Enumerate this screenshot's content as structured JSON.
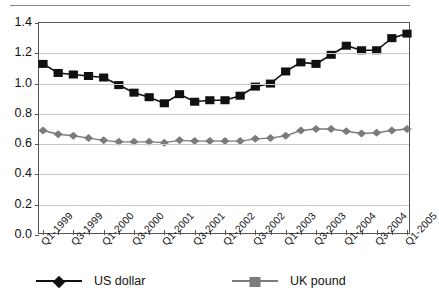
{
  "chart_data": {
    "type": "line",
    "title": "",
    "subtitle": "",
    "xlabel": "",
    "ylabel": "",
    "ylim": [
      0.0,
      1.4
    ],
    "ytick_values": [
      0.0,
      0.2,
      0.4,
      0.6,
      0.8,
      1.0,
      1.2,
      1.4
    ],
    "ytick_labels": [
      "0.0",
      "0.2",
      "0.4",
      "0.6",
      "0.8",
      "1.0",
      "1.2",
      "1.4"
    ],
    "grid": true,
    "grid_axis": "y",
    "legend_position": "bottom",
    "x": [
      "Q1-1999",
      "Q2-1999",
      "Q3-1999",
      "Q4-1999",
      "Q1-2000",
      "Q2-2000",
      "Q3-2000",
      "Q4-2000",
      "Q1-2001",
      "Q2-2001",
      "Q3-2001",
      "Q4-2001",
      "Q1-2002",
      "Q2-2002",
      "Q3-2002",
      "Q4-2002",
      "Q1-2003",
      "Q2-2003",
      "Q3-2003",
      "Q4-2003",
      "Q1-2004",
      "Q2-2004",
      "Q3-2004",
      "Q4-2004",
      "Q1-2005"
    ],
    "xtick_labels_shown": [
      "Q1-1999",
      "Q3-1999",
      "Q1-2000",
      "Q2-2000",
      "Q1-2001",
      "Q2-2001",
      "Q1-2002",
      "Q2-2002",
      "Q1-2003",
      "Q2-2003",
      "Q1-2004",
      "Q2-2004",
      "Q1-2005"
    ],
    "xtick_label_rotation": -47,
    "xtick_label_interval": 2,
    "series": [
      {
        "name": "US dollar",
        "marker": "square",
        "color": "#111111",
        "values": [
          1.13,
          1.07,
          1.06,
          1.05,
          1.04,
          0.99,
          0.94,
          0.91,
          0.87,
          0.93,
          0.88,
          0.89,
          0.89,
          0.92,
          0.98,
          1.0,
          1.08,
          1.14,
          1.13,
          1.19,
          1.25,
          1.22,
          1.22,
          1.3,
          1.33
        ]
      },
      {
        "name": "UK pound",
        "marker": "diamond",
        "color": "#7b7b7b",
        "values": [
          0.69,
          0.665,
          0.655,
          0.64,
          0.625,
          0.615,
          0.615,
          0.615,
          0.61,
          0.625,
          0.62,
          0.62,
          0.62,
          0.62,
          0.635,
          0.64,
          0.655,
          0.69,
          0.7,
          0.7,
          0.685,
          0.67,
          0.675,
          0.69,
          0.7
        ]
      }
    ],
    "legend_entries": [
      {
        "label": "US dollar",
        "marker": "diamond",
        "color": "#111111"
      },
      {
        "label": "UK pound",
        "marker": "square",
        "color": "#7b7b7b"
      }
    ]
  }
}
